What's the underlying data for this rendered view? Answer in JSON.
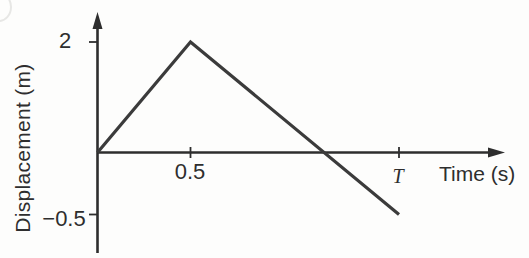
{
  "page": {
    "background": "#fdfdfc"
  },
  "chart_data": {
    "type": "line",
    "title": "",
    "xlabel": "Time (s)",
    "ylabel": "Displacement (m)",
    "x": [
      0,
      0.5,
      "T"
    ],
    "y": [
      0,
      2,
      -0.5
    ],
    "x_ticks": [
      {
        "value": 0.5,
        "label": "0.5"
      },
      {
        "value": "T",
        "label": "T"
      }
    ],
    "y_ticks": [
      {
        "value": 2,
        "label": "2"
      },
      {
        "value": -0.5,
        "label": "−0.5"
      }
    ],
    "axis_color": "#2e2e2e",
    "line_color": "#3b3b3b",
    "grid": false,
    "legend": null
  }
}
